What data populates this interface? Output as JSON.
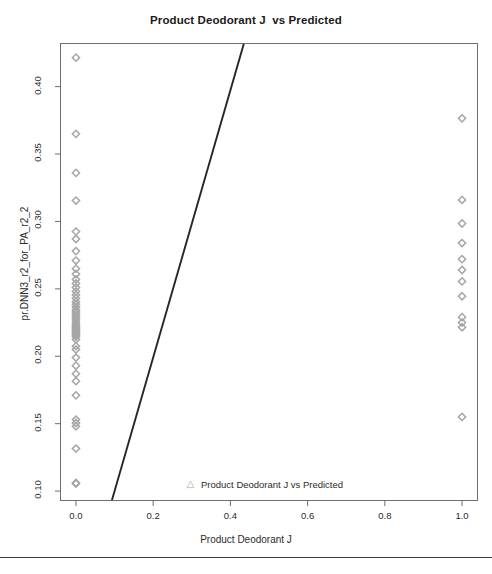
{
  "figure": {
    "title": "Product Deodorant J  vs Predicted",
    "background": "#ffffff",
    "width": 492,
    "height": 574
  },
  "legend": {
    "position": "bottom-center-inside",
    "entries": [
      {
        "label": "Product Deodorant J vs Predicted",
        "marker": "triangle-up-open",
        "color": "#b0b0b0"
      }
    ]
  },
  "axes": {
    "x_tick_labels": [
      "0.0",
      "0.2",
      "0.4",
      "0.6",
      "0.8",
      "1.0"
    ],
    "y_tick_labels": [
      "0.10",
      "0.15",
      "0.20",
      "0.25",
      "0.30",
      "0.35",
      "0.40"
    ]
  },
  "colors": {
    "marker": "#a6a6a6",
    "line": "#262626",
    "frame": "#6e6e6e",
    "text": "#2b2b2b",
    "title": "#1a1a1a"
  },
  "chart_data": {
    "type": "scatter",
    "title": "Product Deodorant J  vs Predicted",
    "xlabel": "Product Deodorant J",
    "ylabel": "pr.DNN3_r2_for_PA_r2_2",
    "xlim": [
      -0.04,
      1.04
    ],
    "ylim": [
      0.093,
      0.432
    ],
    "grid": false,
    "x_ticks": [
      0.0,
      0.2,
      0.4,
      0.6,
      0.8,
      1.0
    ],
    "y_ticks": [
      0.1,
      0.15,
      0.2,
      0.25,
      0.3,
      0.35,
      0.4
    ],
    "marker_style": "diamond",
    "marker_color": "#a6a6a6",
    "series": [
      {
        "name": "Product Deodorant J vs Predicted",
        "x": [
          0.0,
          0.0,
          0.0,
          0.0,
          0.0,
          0.0,
          0.0,
          0.0,
          0.0,
          0.0,
          0.0,
          0.0,
          0.0,
          0.0,
          0.0,
          0.0,
          0.0,
          0.0,
          0.0,
          0.0,
          0.0,
          0.0,
          0.0,
          0.0,
          0.0,
          0.0,
          0.0,
          0.0,
          0.0,
          0.0,
          0.0,
          0.0,
          0.0,
          0.0,
          0.0,
          0.0,
          0.0,
          0.0,
          0.0,
          0.0,
          0.0,
          0.0,
          0.0,
          0.0,
          0.0,
          0.0,
          0.0,
          0.0,
          0.0,
          0.0,
          1.0,
          1.0,
          1.0,
          1.0,
          1.0,
          1.0,
          1.0,
          1.0,
          1.0,
          1.0,
          1.0,
          1.0
        ],
        "y": [
          0.4215,
          0.365,
          0.336,
          0.3155,
          0.2925,
          0.287,
          0.278,
          0.271,
          0.265,
          0.261,
          0.257,
          0.254,
          0.251,
          0.248,
          0.2455,
          0.243,
          0.2405,
          0.2385,
          0.2365,
          0.2345,
          0.233,
          0.2315,
          0.23,
          0.2285,
          0.227,
          0.2255,
          0.224,
          0.2225,
          0.2215,
          0.2205,
          0.2195,
          0.2185,
          0.2175,
          0.2165,
          0.2155,
          0.2145,
          0.2125,
          0.2075,
          0.205,
          0.199,
          0.193,
          0.187,
          0.1815,
          0.171,
          0.153,
          0.1505,
          0.148,
          0.1315,
          0.106,
          0.1055,
          0.3765,
          0.316,
          0.2985,
          0.284,
          0.272,
          0.264,
          0.2555,
          0.2445,
          0.229,
          0.225,
          0.2215,
          0.155
        ]
      }
    ],
    "fit_line": {
      "type": "linear",
      "comment": "regression line drawn across plot, clipped to frame",
      "x_at_bottom": 0.093,
      "x_at_top": 0.435
    }
  }
}
